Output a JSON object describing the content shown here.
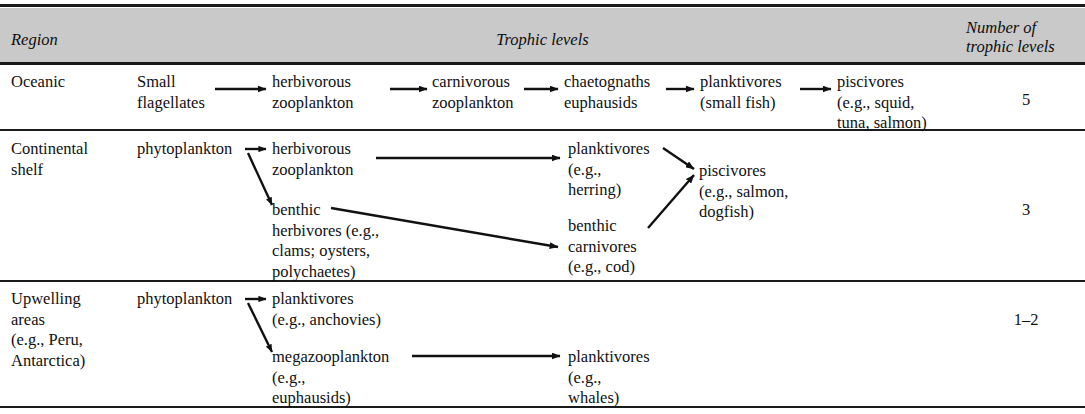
{
  "table": {
    "header": {
      "region_label": "Region",
      "trophic_label": "Trophic levels",
      "number_label": "Number of\ntrophic levels"
    },
    "rows": [
      {
        "region": "Oceanic",
        "count": "5",
        "nodes": [
          "Small\nflagellates",
          "herbivorous\nzooplankton",
          "carnivorous\nzooplankton",
          "chaetognaths\neuphausids",
          "planktivores\n(small fish)",
          "piscivores\n(e.g., squid,\ntuna, salmon)"
        ]
      },
      {
        "region": "Continental\nshelf",
        "count": "3",
        "nodes": [
          "phytoplankton",
          "herbivorous\nzooplankton",
          "benthic\nherbivores (e.g.,\nclams; oysters,\npolychaetes)",
          "planktivores\n(e.g.,\nherring)",
          "benthic\ncarnivores\n(e.g., cod)",
          "piscivores\n(e.g., salmon,\ndogfish)"
        ]
      },
      {
        "region": "Upwelling\nareas\n(e.g., Peru,\nAntarctica)",
        "count": "1–2",
        "nodes": [
          "phytoplankton",
          "planktivores\n(e.g., anchovies)",
          "megazooplankton\n(e.g.,\neuphausids)",
          "planktivores\n(e.g.,\nwhales)"
        ]
      }
    ]
  },
  "colors": {
    "header_band": "#c9c9c9",
    "rule": "#1a1a1a",
    "text": "#111111",
    "page_background": "#ffffff"
  }
}
